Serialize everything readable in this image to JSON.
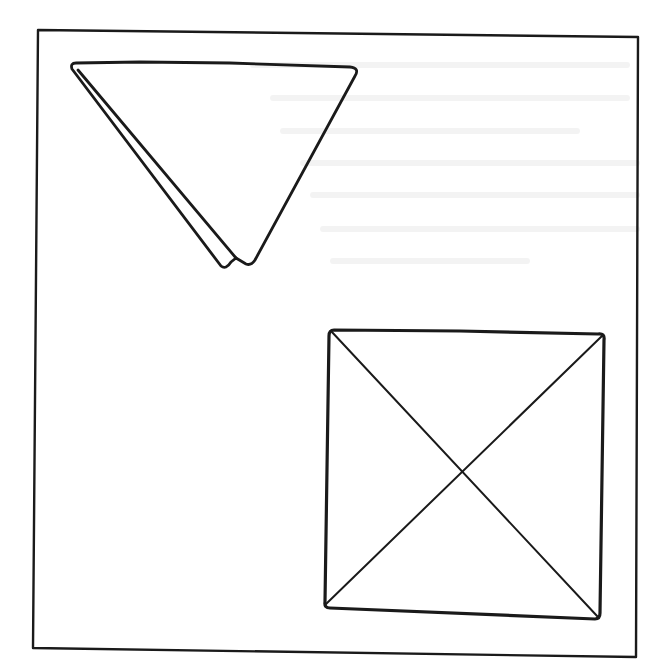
{
  "figure": {
    "stroke_color": "#1a1a1a",
    "background_color": "#ffffff",
    "frame": {
      "points": [
        [
          38,
          30
        ],
        [
          638,
          37
        ],
        [
          636,
          657
        ],
        [
          33,
          648
        ]
      ]
    },
    "triangle": {
      "label": "folded triangle",
      "outer_points": [
        [
          72,
          62
        ],
        [
          355,
          68
        ],
        [
          246,
          264
        ]
      ],
      "fold_line": [
        [
          76,
          70
        ],
        [
          221,
          266
        ],
        [
          234,
          258
        ]
      ]
    },
    "square": {
      "label": "square with diagonals",
      "corners": [
        [
          331,
          330
        ],
        [
          604,
          334
        ],
        [
          598,
          618
        ],
        [
          324,
          606
        ]
      ],
      "diagonals": [
        [
          [
            331,
            330
          ],
          [
            598,
            618
          ]
        ],
        [
          [
            604,
            334
          ],
          [
            324,
            606
          ]
        ]
      ]
    }
  }
}
